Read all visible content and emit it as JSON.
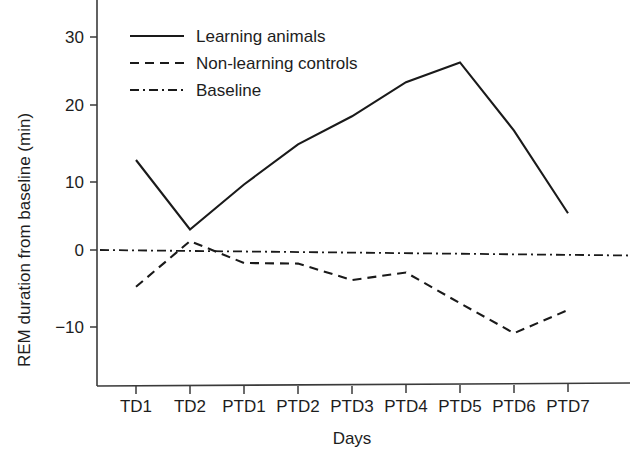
{
  "chart_data": {
    "type": "line",
    "title": "",
    "xlabel": "Days",
    "ylabel": "REM duration from baseline (min)",
    "categories": [
      "TD1",
      "TD2",
      "PTD1",
      "PTD2",
      "PTD3",
      "PTD4",
      "PTD5",
      "PTD6",
      "PTD7"
    ],
    "xtick_labels": [
      "TD1",
      "TD2",
      "PTD1",
      "PTD2",
      "PTD3",
      "PTD4",
      "PTD5",
      "PTD6",
      "PTD7"
    ],
    "ytick_labels": [
      "30",
      "20",
      "10",
      "0",
      "−10"
    ],
    "ytick_values": [
      30,
      20,
      10,
      0,
      -10
    ],
    "ylim": [
      -15,
      35
    ],
    "grid": false,
    "legend_position": "upper-left-inside",
    "series": [
      {
        "name": "Learning animals",
        "style": "solid",
        "color": "#1a1a1a",
        "values": [
          13.2,
          3.0,
          9.6,
          15.5,
          19.6,
          24.6,
          27.5,
          17.5,
          5.4
        ]
      },
      {
        "name": "Non-learning controls",
        "style": "dashed",
        "color": "#1a1a1a",
        "values": [
          -5.4,
          1.3,
          -1.9,
          -2.0,
          -4.4,
          -3.3,
          -7.8,
          -12.2,
          -8.8
        ]
      },
      {
        "name": "Baseline",
        "style": "dash-dot",
        "color": "#1a1a1a",
        "values": [
          0.0,
          -0.1,
          -0.2,
          -0.3,
          -0.4,
          -0.5,
          -0.6,
          -0.7,
          -0.8
        ]
      }
    ]
  },
  "legend": {
    "items": [
      {
        "label": "Learning animals",
        "style": "solid"
      },
      {
        "label": "Non-learning controls",
        "style": "dashed"
      },
      {
        "label": "Baseline",
        "style": "dash-dot"
      }
    ]
  },
  "axes": {
    "y_title": "REM duration from baseline (min)",
    "x_title": "Days",
    "y_ticks": [
      "30",
      "20",
      "10",
      "0",
      "−10"
    ],
    "x_ticks": [
      "TD1",
      "TD2",
      "PTD1",
      "PTD2",
      "PTD3",
      "PTD4",
      "PTD5",
      "PTD6",
      "PTD7"
    ]
  }
}
